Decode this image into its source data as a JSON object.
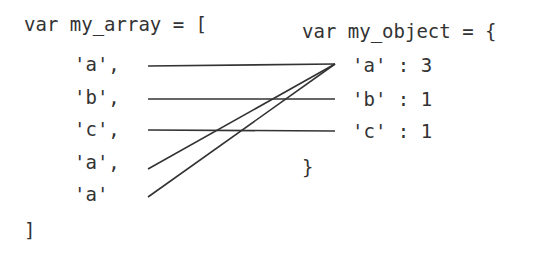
{
  "array": {
    "header": "var my_array = [",
    "items": [
      "'a',",
      "'b',",
      "'c',",
      "'a',",
      "'a'"
    ],
    "footer": "]"
  },
  "object": {
    "header": "var my_object = {",
    "entries": [
      "'a' : 3",
      "'b' : 1",
      "'c' : 1"
    ],
    "footer": "}"
  },
  "colors": {
    "text": "#333333",
    "line": "#333333"
  }
}
